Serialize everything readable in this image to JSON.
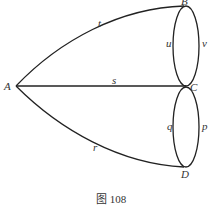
{
  "diagram": {
    "type": "graph",
    "caption": "图 108",
    "vertices": [
      {
        "id": "A",
        "label": "A"
      },
      {
        "id": "B",
        "label": "B"
      },
      {
        "id": "C",
        "label": "C"
      },
      {
        "id": "D",
        "label": "D"
      }
    ],
    "edges": [
      {
        "id": "t",
        "label": "t",
        "from": "A",
        "to": "B"
      },
      {
        "id": "s",
        "label": "s",
        "from": "A",
        "to": "C"
      },
      {
        "id": "r",
        "label": "r",
        "from": "A",
        "to": "D"
      },
      {
        "id": "u",
        "label": "u",
        "from": "B",
        "to": "C"
      },
      {
        "id": "v",
        "label": "v",
        "from": "B",
        "to": "C"
      },
      {
        "id": "q",
        "label": "q",
        "from": "C",
        "to": "D"
      },
      {
        "id": "p",
        "label": "p",
        "from": "C",
        "to": "D"
      }
    ],
    "color": "#222222"
  }
}
